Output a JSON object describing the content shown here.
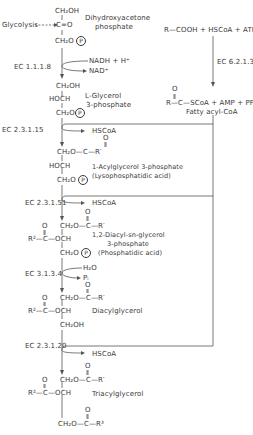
{
  "diagram": {
    "type": "biochemical-pathway",
    "colors": {
      "ink": "#3a3a3a",
      "background": "#ffffff"
    },
    "source_label": "Glycolysis",
    "compounds": {
      "dhap": {
        "lines": [
          "CH₂OH",
          "C=O",
          "CH₂O"
        ],
        "phosphate": "P",
        "name_line1": "Dihydroxyacetone",
        "name_line2": "phosphate"
      },
      "g3p": {
        "lines": [
          "CH₂OH",
          "HOCH",
          "CH₂O"
        ],
        "phosphate": "P",
        "name_line1": "L-Glycerol",
        "name_line2": "3-phosphate"
      },
      "lpa": {
        "ester_top": "CH₂O—C—R′",
        "carbonyl_o": "O",
        "lines": [
          "HOCH",
          "CH₂O"
        ],
        "phosphate": "P",
        "name_line1": "1-Acylglycerol 3-phosphate",
        "name_line2": "(Lysophosphatidic acid)"
      },
      "pa": {
        "ester_top": "CH₂O—C—R′",
        "carbonyl_o": "O",
        "ester_left": "R²—C—OCH",
        "carbonyl_o2": "O",
        "bottom": "CH₂O",
        "phosphate": "P",
        "name_line1": "1,2-Diacyl-sn-glycerol",
        "name_line2": "3-phosphate",
        "name_line3": "(Phosphatidic acid)"
      },
      "dag": {
        "ester_top": "CH₂O—C—R′",
        "carbonyl_o": "O",
        "ester_left": "R²—C—OCH",
        "carbonyl_o2": "O",
        "bottom": "CH₂OH",
        "name": "Diacylglycerol"
      },
      "tag": {
        "ester_top": "CH₂O—C—R′",
        "carbonyl_o": "O",
        "ester_left": "R²—C—OCH",
        "carbonyl_o2": "O",
        "ester_bottom": "CH₂O—C—R³",
        "carbonyl_o3": "O",
        "name": "Triacylglycerol"
      },
      "fatty_acyl_coa": {
        "reactants": "R—COOH + HSCoA + ATP",
        "carbonyl_o": "O",
        "products": "R—C—SCoA + AMP + PPᵢ",
        "name": "Fatty acyl-CoA"
      }
    },
    "enzymes": [
      {
        "id": "ec1",
        "label": "EC 1.1.1.8",
        "side_in": "NADH + H⁺",
        "side_out": "NAD⁺"
      },
      {
        "id": "ec2",
        "label": "EC 2.3.1.15",
        "side_out": "HSCoA"
      },
      {
        "id": "ec3",
        "label": "EC 2.3.1.51",
        "side_out": "HSCoA"
      },
      {
        "id": "ec4",
        "label": "EC 3.1.3.4",
        "side_in": "H₂O",
        "side_out": "Pᵢ"
      },
      {
        "id": "ec5",
        "label": "EC 2.3.1.20",
        "side_out": "HSCoA"
      },
      {
        "id": "ec6",
        "label": "EC 6.2.1.3"
      }
    ]
  }
}
